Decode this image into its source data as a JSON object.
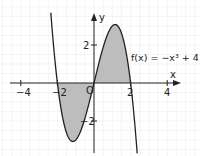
{
  "chart_data": {
    "type": "line",
    "title": "",
    "function_label": "f(x) = −x³ + 4 x",
    "formula": "-x^3 + 4x",
    "xlabel": "x",
    "ylabel": "y",
    "xlim": [
      -4.8,
      4.6
    ],
    "ylim": [
      -3.8,
      4.0
    ],
    "x_ticks": [
      -4,
      -2,
      2,
      4
    ],
    "x_tick_labels": [
      "−4",
      "−2",
      "2",
      "4"
    ],
    "y_ticks": [
      2,
      -2
    ],
    "y_tick_labels": [
      "2",
      "−2"
    ],
    "origin_label": "O",
    "grid": true,
    "roots": [
      -2,
      0,
      2
    ],
    "shaded_regions": [
      {
        "from": -2,
        "to": 0,
        "description": "area between curve and x-axis, below axis"
      },
      {
        "from": 0,
        "to": 2,
        "description": "area between curve and x-axis, above axis"
      }
    ],
    "series": [
      {
        "name": "f(x)",
        "x_range": [
          -2.36,
          2.36
        ]
      }
    ],
    "colors": {
      "curve": "#222222",
      "fill": "#bdbdbd",
      "grid": "#ececec",
      "axis": "#222222"
    }
  }
}
